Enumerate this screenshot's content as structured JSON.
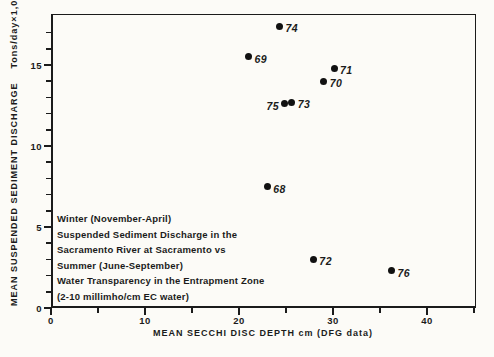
{
  "figure": {
    "background": "#fcfbf7",
    "ink": "#1b1b1b"
  },
  "chart_data": {
    "type": "scatter",
    "title": "",
    "xlabel": "MEAN SECCHI DISC DEPTH cm (DFG data)",
    "ylabel": "MEAN SUSPENDED SEDIMENT DISCHARGE",
    "ylabel_units": "Tons/day×1,000",
    "xlim": [
      0,
      45.2
    ],
    "ylim": [
      0,
      18.15
    ],
    "grid": false,
    "legend": null,
    "x_major_ticks": [
      0,
      10,
      20,
      30,
      40
    ],
    "x_minor_ticks": [
      5,
      15,
      25,
      35,
      45
    ],
    "y_major_ticks": [
      0,
      5,
      10,
      15
    ],
    "y_minor_ticks": [
      1,
      2,
      3,
      4,
      6,
      7,
      8,
      9,
      11,
      12,
      13,
      14,
      16,
      17
    ],
    "points": [
      {
        "label": "68",
        "x": 23.0,
        "y": 7.5,
        "label_side": "right"
      },
      {
        "label": "69",
        "x": 21.0,
        "y": 15.5,
        "label_side": "right"
      },
      {
        "label": "70",
        "x": 29.0,
        "y": 14.0,
        "label_side": "right"
      },
      {
        "label": "71",
        "x": 30.1,
        "y": 14.8,
        "label_side": "right"
      },
      {
        "label": "72",
        "x": 27.9,
        "y": 3.0,
        "label_side": "right"
      },
      {
        "label": "73",
        "x": 25.6,
        "y": 12.7,
        "label_side": "right"
      },
      {
        "label": "74",
        "x": 24.3,
        "y": 17.4,
        "label_side": "right"
      },
      {
        "label": "75",
        "x": 24.8,
        "y": 12.6,
        "label_side": "left"
      },
      {
        "label": "76",
        "x": 36.2,
        "y": 2.3,
        "label_side": "right"
      }
    ],
    "annotation": {
      "lines": [
        "Winter (November-April)",
        "Suspended Sediment Discharge in the",
        "Sacramento River at Sacramento vs",
        "Summer (June-September)",
        "Water Transparency in the Entrapment Zone",
        "(2-10 millimho/cm EC water)"
      ]
    }
  }
}
